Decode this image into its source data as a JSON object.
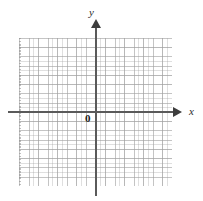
{
  "figure": {
    "type": "coordinate-grid",
    "width": 203,
    "height": 201,
    "background_color": "#ffffff"
  },
  "axes": {
    "x_label": "x",
    "y_label": "y",
    "origin_label": "0",
    "axis_color": "#5a5a5a",
    "arrow_color": "#3d3d3d",
    "x_arrow_direction": "right",
    "y_arrow_direction": "up"
  },
  "grid": {
    "line_color": "#a0a0a0",
    "major_columns": 16,
    "major_rows": 16,
    "minor_subdivisions": 2,
    "tick_labels": []
  },
  "chart_data": {
    "type": "scatter",
    "title": "",
    "subtitle": "",
    "xlabel": "x",
    "ylabel": "y",
    "origin_label": "0",
    "grid": true,
    "legend": null,
    "legend_position": "none",
    "annotations": [],
    "series": [],
    "x": [],
    "values": [],
    "xlim": [
      -8,
      8
    ],
    "ylim": [
      -8,
      8
    ],
    "xticks": [],
    "yticks": [],
    "xticklabels": [],
    "yticklabels": []
  }
}
